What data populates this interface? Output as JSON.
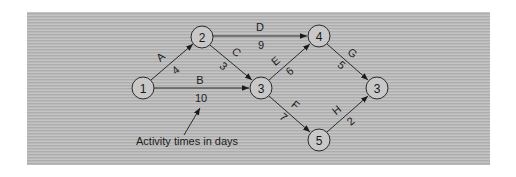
{
  "diagram": {
    "type": "activity-on-arrow network",
    "background_color": "#bdbdbd",
    "nodes": [
      {
        "id": "n1",
        "label": "1",
        "x": 143,
        "y": 88
      },
      {
        "id": "n2",
        "label": "2",
        "x": 202,
        "y": 37
      },
      {
        "id": "n3a",
        "label": "3",
        "x": 261,
        "y": 88
      },
      {
        "id": "n4",
        "label": "4",
        "x": 319,
        "y": 36
      },
      {
        "id": "n3b",
        "label": "3",
        "x": 377,
        "y": 88
      },
      {
        "id": "n5",
        "label": "5",
        "x": 319,
        "y": 140
      }
    ],
    "edges": [
      {
        "from": "n1",
        "to": "n2",
        "activity": "A",
        "time": "4"
      },
      {
        "from": "n1",
        "to": "n3a",
        "activity": "B",
        "time": "10"
      },
      {
        "from": "n2",
        "to": "n3a",
        "activity": "C",
        "time": "3"
      },
      {
        "from": "n2",
        "to": "n4",
        "activity": "D",
        "time": "9"
      },
      {
        "from": "n3a",
        "to": "n4",
        "activity": "E",
        "time": "6"
      },
      {
        "from": "n3a",
        "to": "n5",
        "activity": "F",
        "time": "7"
      },
      {
        "from": "n4",
        "to": "n3b",
        "activity": "G",
        "time": "5"
      },
      {
        "from": "n5",
        "to": "n3b",
        "activity": "H",
        "time": "2"
      }
    ],
    "annotation": {
      "text": "Activity times in days",
      "points_to": "10"
    }
  },
  "labels": {
    "node1": "1",
    "node2": "2",
    "node3a": "3",
    "node4": "4",
    "node3b": "3",
    "node5": "5",
    "A": "A",
    "A_time": "4",
    "B": "B",
    "B_time": "10",
    "C": "C",
    "C_time": "3",
    "D": "D",
    "D_time": "9",
    "E": "E",
    "E_time": "6",
    "F": "F",
    "F_time": "7",
    "G": "G",
    "G_time": "5",
    "H": "H",
    "H_time": "2",
    "annotation": "Activity times in days"
  }
}
